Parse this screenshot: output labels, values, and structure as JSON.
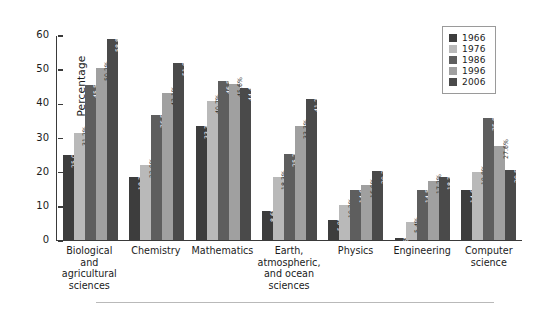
{
  "chart_data": {
    "type": "bar",
    "title": "",
    "xlabel": "",
    "ylabel": "Percentage",
    "ylim": [
      0,
      60
    ],
    "yticks": [
      0,
      10,
      20,
      30,
      40,
      50,
      60
    ],
    "grid": false,
    "legend_position": "top-right",
    "categories": [
      "Biological and agricultural sciences",
      "Chemistry",
      "Mathematics",
      "Earth, atmospheric, and ocean sciences",
      "Physics",
      "Engineering",
      "Computer science"
    ],
    "category_lines": [
      [
        "Biological and",
        "agricultural",
        "sciences"
      ],
      [
        "Chemistry"
      ],
      [
        "Mathematics"
      ],
      [
        "Earth,",
        "atmospheric,",
        "and ocean",
        "sciences"
      ],
      [
        "Physics"
      ],
      [
        "Engineering"
      ],
      [
        "Computer",
        "science"
      ]
    ],
    "series": [
      {
        "name": "1966",
        "color": "#3d3d3d",
        "values": [
          25.0,
          18.3,
          33.3,
          8.6,
          5.9,
          0.6,
          14.6
        ],
        "labels": [
          "25.0%",
          "18.3%",
          "33.3%",
          "8.6%",
          "5.9%",
          "0.6%",
          "14.6%"
        ]
      },
      {
        "name": "1976",
        "color": "#b9b9b9",
        "values": [
          31.2,
          22.0,
          40.7,
          18.3,
          10.2,
          5.4,
          19.8
        ],
        "labels": [
          "31.2%",
          "22.0%",
          "40.7%",
          "18.3%",
          "10.2%",
          "5.4%",
          "19.8%"
        ]
      },
      {
        "name": "1986",
        "color": "#5e5e5e",
        "values": [
          45.5,
          36.5,
          46.5,
          25.2,
          14.6,
          14.5,
          35.8
        ],
        "labels": [
          "45.5%",
          "36.5%",
          "46.5%",
          "25.2%",
          "14.6%",
          "14.5%",
          "35.8%"
        ]
      },
      {
        "name": "1996",
        "color": "#a0a0a0",
        "values": [
          50.2,
          43.1,
          45.6,
          33.3,
          16.0,
          17.2,
          27.6
        ],
        "labels": [
          "50.2%",
          "43.1%",
          "45.6%",
          "33.3%",
          "16.0%",
          "17.2%",
          "27.6%"
        ]
      },
      {
        "name": "2006",
        "color": "#4a4a4a",
        "values": [
          58.8,
          51.8,
          44.4,
          41.2,
          20.2,
          18.3,
          20.5
        ],
        "labels": [
          "58.8%",
          "51.8%",
          "44.4%",
          "41.2%",
          "20.2%",
          "18.3%",
          "20.5%"
        ]
      }
    ]
  },
  "legend": {
    "items": [
      {
        "label": "1966",
        "color": "#3d3d3d"
      },
      {
        "label": "1976",
        "color": "#b9b9b9"
      },
      {
        "label": "1986",
        "color": "#5e5e5e"
      },
      {
        "label": "1996",
        "color": "#a0a0a0"
      },
      {
        "label": "2006",
        "color": "#4a4a4a"
      }
    ]
  }
}
